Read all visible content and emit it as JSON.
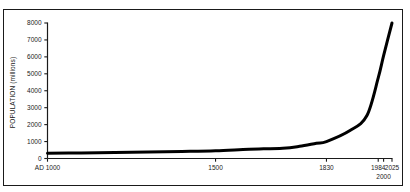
{
  "chart_data": {
    "type": "line",
    "title": "",
    "xlabel": "",
    "ylabel": "POPULATION (millions)",
    "ylim": [
      0,
      8000
    ],
    "xlim": [
      1000,
      2025
    ],
    "grid": false,
    "legend": "none",
    "y_ticks": [
      0,
      1000,
      2000,
      3000,
      4000,
      5000,
      6000,
      7000,
      8000
    ],
    "y_tick_labels": [
      "0",
      "1000",
      "2000",
      "3000",
      "4000",
      "5000",
      "6000",
      "7000",
      "8000"
    ],
    "x_ticks": [
      1000,
      1500,
      1830,
      1984,
      2025
    ],
    "x_tick_labels": [
      "AD 1000",
      "1500",
      "1830",
      "1984",
      "2025"
    ],
    "x_tick_labels_second_row": [
      "2000"
    ],
    "series": [
      {
        "name": "World population",
        "x": [
          1000,
          1100,
          1200,
          1300,
          1400,
          1500,
          1600,
          1700,
          1750,
          1800,
          1830,
          1900,
          1950,
          1984,
          2000,
          2025
        ],
        "values": [
          310,
          330,
          360,
          390,
          420,
          460,
          545,
          610,
          720,
          900,
          1000,
          1650,
          2520,
          4760,
          6070,
          8000
        ]
      }
    ],
    "line_color": "#000000",
    "line_width": 3,
    "background_color": "#ffffff",
    "axis_color": "#1a1a1a"
  }
}
